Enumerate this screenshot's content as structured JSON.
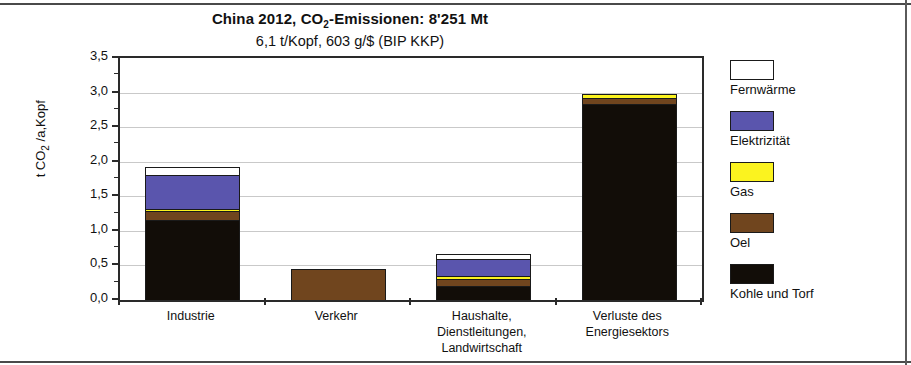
{
  "title": {
    "main_prefix": "China 2012, CO",
    "main_sub": "2",
    "main_suffix": "-Emissionen: 8'251 Mt",
    "subtitle": "6,1 t/Kopf,    603 g/$  (BIP KKP)"
  },
  "axis": {
    "y_title_prefix": "t CO",
    "y_title_sub": "2",
    "y_title_suffix": " /a,Kopf"
  },
  "legend": {
    "items": [
      {
        "label": "Fernwärme",
        "color": "#ffffff"
      },
      {
        "label": "Elektrizität",
        "color": "#5a55ad"
      },
      {
        "label": "Gas",
        "color": "#fbf31f"
      },
      {
        "label": "Oel",
        "color": "#70451e"
      },
      {
        "label": "Kohle und Torf",
        "color": "#120d08"
      }
    ]
  },
  "chart_data": {
    "type": "bar",
    "subtype": "stacked",
    "title": "China 2012, CO2-Emissionen: 8'251 Mt",
    "subtitle": "6,1 t/Kopf,    603 g/$  (BIP KKP)",
    "xlabel": "",
    "ylabel": "t CO2 /a,Kopf",
    "ylim": [
      0,
      3.5
    ],
    "ytick_labels": [
      "0,0",
      "0,5",
      "1,0",
      "1,5",
      "2,0",
      "2,5",
      "3,0",
      "3,5"
    ],
    "ytick_values": [
      0,
      0.5,
      1.0,
      1.5,
      2.0,
      2.5,
      3.0,
      3.5
    ],
    "yminor_step": 0.25,
    "grid": true,
    "legend_position": "right",
    "categories": [
      "Industrie",
      "Verkehr",
      "Haushalte, Dienstleitungen, Landwirtschaft",
      "Verluste des Energiesektors"
    ],
    "category_lines": [
      [
        "Industrie"
      ],
      [
        "Verkehr"
      ],
      [
        "Haushalte,",
        "Dienstleitungen,",
        "Landwirtschaft"
      ],
      [
        "Verluste des",
        "Energiesektors"
      ]
    ],
    "series": [
      {
        "name": "Kohle und Torf",
        "color": "#120d08",
        "values": [
          1.16,
          0.0,
          0.2,
          2.85
        ]
      },
      {
        "name": "Oel",
        "color": "#70451e",
        "values": [
          0.13,
          0.45,
          0.11,
          0.09
        ]
      },
      {
        "name": "Gas",
        "color": "#fbf31f",
        "values": [
          0.03,
          0.0,
          0.04,
          0.04
        ]
      },
      {
        "name": "Elektrizität",
        "color": "#5a55ad",
        "values": [
          0.5,
          0.0,
          0.25,
          0.0
        ]
      },
      {
        "name": "Fernwärme",
        "color": "#ffffff",
        "values": [
          0.11,
          0.0,
          0.07,
          0.0
        ]
      }
    ],
    "totals": [
      1.93,
      0.45,
      0.67,
      2.98
    ]
  }
}
